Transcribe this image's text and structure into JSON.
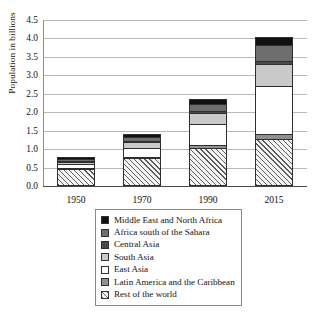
{
  "chart_data": {
    "type": "bar",
    "title": "",
    "subtitle": "",
    "xlabel": "",
    "ylabel": "Population in billions",
    "categories": [
      "1950",
      "1970",
      "1990",
      "2015"
    ],
    "ylim": [
      0.0,
      4.5
    ],
    "ytick_labels": [
      "0.0",
      "0.5",
      "1.0",
      "1.5",
      "2.0",
      "2.5",
      "3.0",
      "3.5",
      "4.0",
      "4.5"
    ],
    "ytick_values": [
      0.0,
      0.5,
      1.0,
      1.5,
      2.0,
      2.5,
      3.0,
      3.5,
      4.0,
      4.5
    ],
    "grid": true,
    "stacked": true,
    "legend_position": "below-center",
    "stack_order_bottom_to_top": [
      "Rest of the world",
      "Latin America and the Caribbean",
      "East Asia",
      "South Asia",
      "Central Asia",
      "Africa south of the Sahara",
      "Middle East and North Africa"
    ],
    "series": [
      {
        "name": "Middle East and North Africa",
        "swatch": "#111111",
        "pattern": "solid",
        "values": [
          0.05,
          0.08,
          0.13,
          0.24
        ]
      },
      {
        "name": "Africa south of the Sahara",
        "swatch": "#6e6e6e",
        "pattern": "solid",
        "values": [
          0.06,
          0.1,
          0.19,
          0.42
        ]
      },
      {
        "name": "Central Asia",
        "swatch": "#4a4a4a",
        "pattern": "solid",
        "values": [
          0.02,
          0.03,
          0.05,
          0.07
        ]
      },
      {
        "name": "South Asia",
        "swatch": "#c9c9c9",
        "pattern": "solid",
        "values": [
          0.05,
          0.15,
          0.3,
          0.62
        ]
      },
      {
        "name": "East Asia",
        "swatch": "#ffffff",
        "pattern": "solid",
        "values": [
          0.1,
          0.25,
          0.58,
          1.28
        ]
      },
      {
        "name": "Latin America and the Caribbean",
        "swatch": "#909090",
        "pattern": "solid",
        "values": [
          0.04,
          0.04,
          0.08,
          0.14
        ]
      },
      {
        "name": "Rest of the world",
        "swatch": "#f4f4f4",
        "pattern": "hatch-45",
        "values": [
          0.46,
          0.75,
          1.02,
          1.28
        ]
      }
    ],
    "totals": [
      0.78,
      1.4,
      2.35,
      4.05
    ]
  },
  "legend": {
    "items": [
      {
        "label": "Middle East and North Africa",
        "swatch_class": "sw-mena",
        "icon": "legend-swatch-solid-black"
      },
      {
        "label": "Africa south of the Sahara",
        "swatch_class": "sw-africa",
        "icon": "legend-swatch-solid-gray"
      },
      {
        "label": "Central Asia",
        "swatch_class": "sw-casia",
        "icon": "legend-swatch-solid-darkgray"
      },
      {
        "label": "South Asia",
        "swatch_class": "sw-sasia",
        "icon": "legend-swatch-solid-lightgray"
      },
      {
        "label": "East Asia",
        "swatch_class": "sw-easia",
        "icon": "legend-swatch-solid-white"
      },
      {
        "label": "Latin America and the Caribbean",
        "swatch_class": "sw-latam",
        "icon": "legend-swatch-solid-midgray"
      },
      {
        "label": "Rest of the world",
        "swatch_class": "sw-rest",
        "icon": "legend-swatch-hatched"
      }
    ]
  }
}
